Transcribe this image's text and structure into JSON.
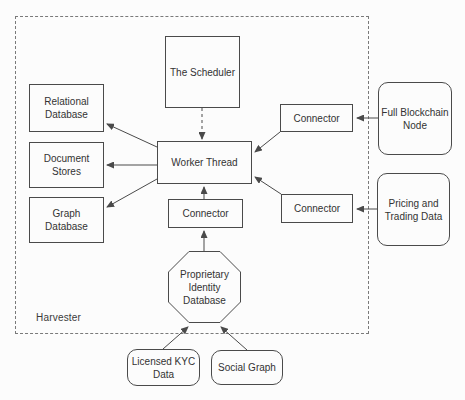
{
  "diagram": {
    "colors": {
      "background": "#fcfcfc",
      "stroke": "#4a4a4a",
      "text": "#333333"
    },
    "container": {
      "label": "Harvester",
      "x": 15,
      "y": 16,
      "w": 354,
      "h": 318
    },
    "nodes": [
      {
        "id": "scheduler",
        "shape": "rect",
        "x": 165,
        "y": 36,
        "w": 75,
        "h": 72,
        "label": "The Scheduler"
      },
      {
        "id": "relational-database",
        "shape": "rect",
        "x": 29,
        "y": 84,
        "w": 75,
        "h": 48,
        "label": "Relational\nDatabase"
      },
      {
        "id": "document-stores",
        "shape": "rect",
        "x": 29,
        "y": 142,
        "w": 75,
        "h": 46,
        "label": "Document\nStores"
      },
      {
        "id": "graph-database",
        "shape": "rect",
        "x": 29,
        "y": 197,
        "w": 75,
        "h": 46,
        "label": "Graph\nDatabase"
      },
      {
        "id": "worker-thread",
        "shape": "rect",
        "x": 157,
        "y": 141,
        "w": 95,
        "h": 43,
        "label": "Worker Thread"
      },
      {
        "id": "connector-top-right",
        "shape": "rect",
        "x": 280,
        "y": 104,
        "w": 73,
        "h": 28,
        "label": "Connector"
      },
      {
        "id": "connector-bottom-right",
        "shape": "rect",
        "x": 281,
        "y": 194,
        "w": 72,
        "h": 29,
        "label": "Connector"
      },
      {
        "id": "connector-bottom",
        "shape": "rect",
        "x": 168,
        "y": 199,
        "w": 75,
        "h": 29,
        "label": "Connector"
      },
      {
        "id": "proprietary-identity-database",
        "shape": "octagon",
        "x": 168,
        "y": 251,
        "w": 73,
        "h": 72,
        "label": "Proprietary\nIdentity\nDatabase"
      },
      {
        "id": "full-blockchain-node",
        "shape": "rounded",
        "x": 378,
        "y": 82,
        "w": 74,
        "h": 73,
        "label": "Full Blockchain\nNode"
      },
      {
        "id": "pricing-trading-data",
        "shape": "rounded",
        "x": 377,
        "y": 173,
        "w": 73,
        "h": 73,
        "label": "Pricing and\nTrading Data"
      },
      {
        "id": "licensed-kyc-data",
        "shape": "rounded",
        "x": 127,
        "y": 349,
        "w": 73,
        "h": 37,
        "label": "Licensed KYC\nData"
      },
      {
        "id": "social-graph",
        "shape": "rounded",
        "x": 211,
        "y": 350,
        "w": 72,
        "h": 35,
        "label": "Social Graph"
      }
    ],
    "edges": [
      {
        "id": "scheduler-to-worker",
        "from": "scheduler",
        "to": "worker-thread",
        "x1": 202,
        "y1": 108,
        "x2": 202,
        "y2": 139,
        "dashed": true
      },
      {
        "id": "worker-to-relational",
        "from": "worker-thread",
        "to": "relational-database",
        "x1": 157,
        "y1": 147,
        "x2": 107,
        "y2": 124,
        "dashed": false
      },
      {
        "id": "worker-to-document",
        "from": "worker-thread",
        "to": "document-stores",
        "x1": 157,
        "y1": 165,
        "x2": 107,
        "y2": 165,
        "dashed": false
      },
      {
        "id": "worker-to-graph",
        "from": "worker-thread",
        "to": "graph-database",
        "x1": 157,
        "y1": 179,
        "x2": 107,
        "y2": 207,
        "dashed": false
      },
      {
        "id": "connector-top-right-to-worker",
        "from": "connector-top-right",
        "to": "worker-thread",
        "x1": 280,
        "y1": 132,
        "x2": 255,
        "y2": 152,
        "dashed": false
      },
      {
        "id": "connector-bottom-right-to-worker",
        "from": "connector-bottom-right",
        "to": "worker-thread",
        "x1": 281,
        "y1": 194,
        "x2": 255,
        "y2": 177,
        "dashed": false
      },
      {
        "id": "connector-bottom-to-worker",
        "from": "connector-bottom",
        "to": "worker-thread",
        "x1": 204,
        "y1": 199,
        "x2": 204,
        "y2": 187,
        "dashed": false
      },
      {
        "id": "octagon-to-connector-bottom",
        "from": "proprietary-identity-database",
        "to": "connector-bottom",
        "x1": 204,
        "y1": 251,
        "x2": 204,
        "y2": 231,
        "dashed": false
      },
      {
        "id": "kyc-to-octagon",
        "from": "licensed-kyc-data",
        "to": "proprietary-identity-database",
        "x1": 163,
        "y1": 349,
        "x2": 188,
        "y2": 327,
        "dashed": false
      },
      {
        "id": "social-to-octagon",
        "from": "social-graph",
        "to": "proprietary-identity-database",
        "x1": 247,
        "y1": 350,
        "x2": 221,
        "y2": 327,
        "dashed": false
      },
      {
        "id": "blockchain-to-connector",
        "from": "full-blockchain-node",
        "to": "connector-top-right",
        "x1": 378,
        "y1": 118,
        "x2": 357,
        "y2": 118,
        "dashed": false
      },
      {
        "id": "pricing-to-connector",
        "from": "pricing-trading-data",
        "to": "connector-bottom-right",
        "x1": 377,
        "y1": 209,
        "x2": 357,
        "y2": 209,
        "dashed": false
      }
    ]
  }
}
